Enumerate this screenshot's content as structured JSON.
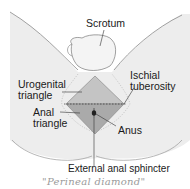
{
  "figure": {
    "labels": {
      "scrotum": "Scrotum",
      "urogenital_triangle": [
        "Urogenital",
        "triangle"
      ],
      "ischial_tuberosity": [
        "Ischial",
        "tuberosity"
      ],
      "anal_triangle": [
        "Anal",
        "triangle"
      ],
      "anus": "Anus",
      "external_anal_sphincter": "External anal sphincter"
    },
    "handwritten_caption": "\"Perineal diamond\"",
    "colors": {
      "skin": "#ececec",
      "outline": "#8a8a8a",
      "diamond_fill": "#b5b5b5",
      "diamond_edge": "#8c8c8c",
      "text": "#1a1a1a",
      "caption": "#9a9a9a"
    }
  }
}
